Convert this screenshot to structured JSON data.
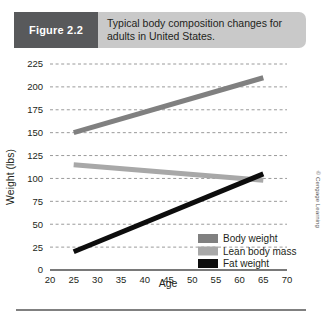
{
  "header": {
    "figure_tag": "Figure 2.2",
    "caption": "Typical body composition changes for adults in United States."
  },
  "credit": "© Cengage Learning",
  "colors": {
    "body_weight": "#808080",
    "lean_body_mass": "#a8a8a8",
    "fat_weight": "#0d0d0d",
    "tag_background": "#58595b",
    "banner_background": "#c9c9c9",
    "gridline": "#9a9a9a",
    "axis": "#4d4d4d"
  },
  "chart_data": {
    "type": "line",
    "title": "Typical body composition changes for adults in United States.",
    "xlabel": "Age",
    "ylabel": "Weight (lbs)",
    "xlim": [
      20,
      70
    ],
    "ylim": [
      0,
      225
    ],
    "xticks": [
      20,
      25,
      30,
      35,
      40,
      45,
      50,
      55,
      60,
      65,
      70
    ],
    "yticks": [
      0,
      25,
      50,
      75,
      100,
      125,
      150,
      175,
      200,
      225
    ],
    "grid": true,
    "legend_position": "bottom-right",
    "x": [
      25,
      65
    ],
    "series": [
      {
        "name": "Body weight",
        "values": [
          150,
          210
        ],
        "color": "#808080"
      },
      {
        "name": "Lean body mass",
        "values": [
          115,
          98
        ],
        "color": "#a8a8a8"
      },
      {
        "name": "Fat weight",
        "values": [
          20,
          105
        ],
        "color": "#0d0d0d"
      }
    ]
  }
}
